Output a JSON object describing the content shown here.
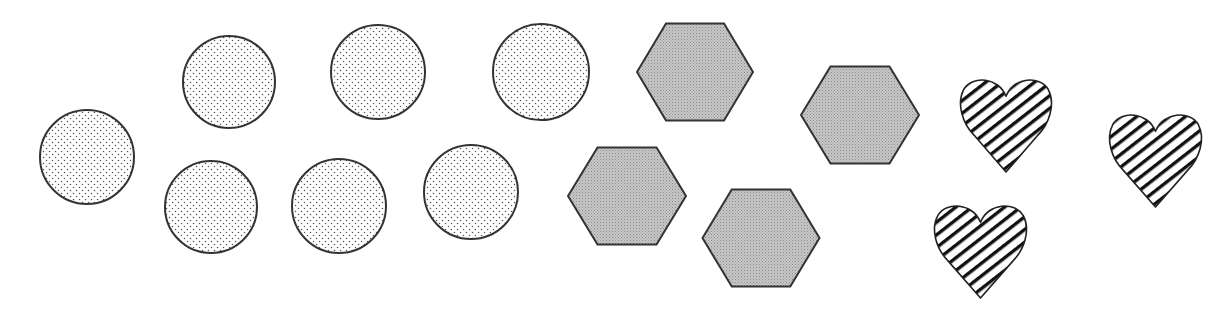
{
  "figure": {
    "width": 1219,
    "height": 313,
    "background": "#ffffff",
    "stroke_color": "#333333",
    "groups": [
      {
        "name": "circles",
        "type": "circle",
        "fill_style": "dotted",
        "count": 7,
        "items": [
          {
            "cx": 87,
            "cy": 157,
            "r": 47
          },
          {
            "cx": 229,
            "cy": 82,
            "r": 46
          },
          {
            "cx": 378,
            "cy": 72,
            "r": 47
          },
          {
            "cx": 541,
            "cy": 72,
            "r": 48
          },
          {
            "cx": 211,
            "cy": 207,
            "r": 46
          },
          {
            "cx": 339,
            "cy": 206,
            "r": 47
          },
          {
            "cx": 471,
            "cy": 192,
            "r": 47
          }
        ]
      },
      {
        "name": "hexagons",
        "type": "hexagon",
        "fill_style": "gray-stipple",
        "fill_color": "#bdbdbd",
        "count": 4,
        "items": [
          {
            "cx": 695,
            "cy": 72,
            "w": 116,
            "h": 97
          },
          {
            "cx": 860,
            "cy": 115,
            "w": 118,
            "h": 97
          },
          {
            "cx": 627,
            "cy": 196,
            "w": 118,
            "h": 97
          },
          {
            "cx": 761,
            "cy": 238,
            "w": 117,
            "h": 97
          }
        ]
      },
      {
        "name": "hearts",
        "type": "heart",
        "fill_style": "diagonal-stripes",
        "count": 3,
        "items": [
          {
            "x": 959,
            "y": 75,
            "w": 94,
            "h": 97
          },
          {
            "x": 1108,
            "y": 110,
            "w": 95,
            "h": 97
          },
          {
            "x": 933,
            "y": 201,
            "w": 95,
            "h": 97
          }
        ]
      }
    ]
  }
}
